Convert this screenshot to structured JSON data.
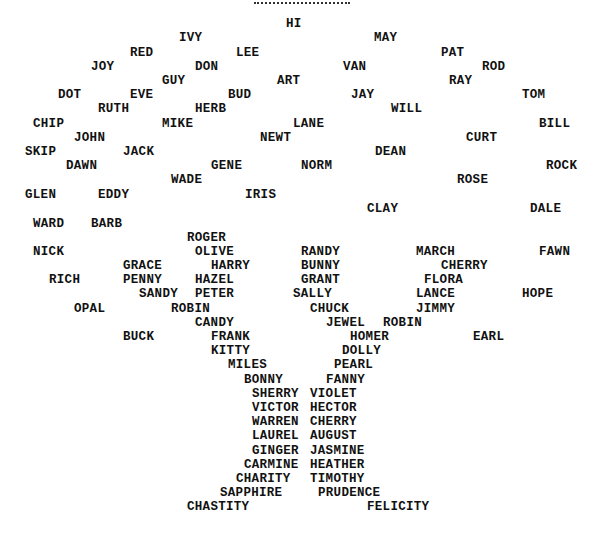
{
  "figure": {
    "names": [
      {
        "text": "HI",
        "x": 286,
        "y": 24
      },
      {
        "text": "IVY",
        "x": 179,
        "y": 38
      },
      {
        "text": "MAY",
        "x": 374,
        "y": 38
      },
      {
        "text": "RED",
        "x": 130,
        "y": 53
      },
      {
        "text": "LEE",
        "x": 236,
        "y": 53
      },
      {
        "text": "PAT",
        "x": 441,
        "y": 53
      },
      {
        "text": "JOY",
        "x": 91,
        "y": 67
      },
      {
        "text": "DON",
        "x": 195,
        "y": 67
      },
      {
        "text": "VAN",
        "x": 343,
        "y": 67
      },
      {
        "text": "ROD",
        "x": 482,
        "y": 67
      },
      {
        "text": "GUY",
        "x": 162,
        "y": 81
      },
      {
        "text": "ART",
        "x": 277,
        "y": 81
      },
      {
        "text": "RAY",
        "x": 449,
        "y": 81
      },
      {
        "text": "DOT",
        "x": 58,
        "y": 95
      },
      {
        "text": "EVE",
        "x": 130,
        "y": 95
      },
      {
        "text": "BUD",
        "x": 228,
        "y": 95
      },
      {
        "text": "JAY",
        "x": 351,
        "y": 95
      },
      {
        "text": "TOM",
        "x": 522,
        "y": 95
      },
      {
        "text": "RUTH",
        "x": 98,
        "y": 109
      },
      {
        "text": "HERB",
        "x": 195,
        "y": 109
      },
      {
        "text": "WILL",
        "x": 391,
        "y": 109
      },
      {
        "text": "CHIP",
        "x": 33,
        "y": 124
      },
      {
        "text": "MIKE",
        "x": 162,
        "y": 124
      },
      {
        "text": "LANE",
        "x": 293,
        "y": 124
      },
      {
        "text": "BILL",
        "x": 539,
        "y": 124
      },
      {
        "text": "JOHN",
        "x": 74,
        "y": 138
      },
      {
        "text": "NEWT",
        "x": 260,
        "y": 138
      },
      {
        "text": "CURT",
        "x": 466,
        "y": 138
      },
      {
        "text": "SKIP",
        "x": 25,
        "y": 152
      },
      {
        "text": "JACK",
        "x": 123,
        "y": 152
      },
      {
        "text": "DEAN",
        "x": 375,
        "y": 152
      },
      {
        "text": "DAWN",
        "x": 66,
        "y": 166
      },
      {
        "text": "GENE",
        "x": 211,
        "y": 166
      },
      {
        "text": "NORM",
        "x": 301,
        "y": 166
      },
      {
        "text": "ROCK",
        "x": 546,
        "y": 166
      },
      {
        "text": "WADE",
        "x": 171,
        "y": 180
      },
      {
        "text": "ROSE",
        "x": 457,
        "y": 180
      },
      {
        "text": "GLEN",
        "x": 25,
        "y": 195
      },
      {
        "text": "EDDY",
        "x": 98,
        "y": 195
      },
      {
        "text": "IRIS",
        "x": 245,
        "y": 195
      },
      {
        "text": "CLAY",
        "x": 367,
        "y": 209
      },
      {
        "text": "DALE",
        "x": 530,
        "y": 209
      },
      {
        "text": "WARD",
        "x": 33,
        "y": 224
      },
      {
        "text": "BARB",
        "x": 91,
        "y": 224
      },
      {
        "text": "ROGER",
        "x": 187,
        "y": 238
      },
      {
        "text": "NICK",
        "x": 33,
        "y": 252
      },
      {
        "text": "OLIVE",
        "x": 195,
        "y": 252
      },
      {
        "text": "RANDY",
        "x": 301,
        "y": 252
      },
      {
        "text": "MARCH",
        "x": 416,
        "y": 252
      },
      {
        "text": "FAWN",
        "x": 539,
        "y": 252
      },
      {
        "text": "GRACE",
        "x": 123,
        "y": 266
      },
      {
        "text": "HARRY",
        "x": 211,
        "y": 266
      },
      {
        "text": "BUNNY",
        "x": 301,
        "y": 266
      },
      {
        "text": "CHERRY",
        "x": 441,
        "y": 266
      },
      {
        "text": "RICH",
        "x": 49,
        "y": 280
      },
      {
        "text": "PENNY",
        "x": 123,
        "y": 280
      },
      {
        "text": "HAZEL",
        "x": 195,
        "y": 280
      },
      {
        "text": "GRANT",
        "x": 301,
        "y": 280
      },
      {
        "text": "FLORA",
        "x": 424,
        "y": 280
      },
      {
        "text": "SANDY",
        "x": 139,
        "y": 294
      },
      {
        "text": "PETER",
        "x": 195,
        "y": 294
      },
      {
        "text": "SALLY",
        "x": 293,
        "y": 294
      },
      {
        "text": "LANCE",
        "x": 416,
        "y": 294
      },
      {
        "text": "HOPE",
        "x": 522,
        "y": 294
      },
      {
        "text": "OPAL",
        "x": 74,
        "y": 309
      },
      {
        "text": "ROBIN",
        "x": 171,
        "y": 309
      },
      {
        "text": "CHUCK",
        "x": 310,
        "y": 309
      },
      {
        "text": "JIMMY",
        "x": 416,
        "y": 309
      },
      {
        "text": "CANDY",
        "x": 195,
        "y": 323
      },
      {
        "text": "JEWEL",
        "x": 326,
        "y": 323
      },
      {
        "text": "ROBIN",
        "x": 383,
        "y": 323
      },
      {
        "text": "BUCK",
        "x": 123,
        "y": 337
      },
      {
        "text": "FRANK",
        "x": 211,
        "y": 337
      },
      {
        "text": "HOMER",
        "x": 350,
        "y": 337
      },
      {
        "text": "EARL",
        "x": 473,
        "y": 337
      },
      {
        "text": "KITTY",
        "x": 211,
        "y": 351
      },
      {
        "text": "DOLLY",
        "x": 342,
        "y": 351
      },
      {
        "text": "MILES",
        "x": 228,
        "y": 365
      },
      {
        "text": "PEARL",
        "x": 334,
        "y": 365
      },
      {
        "text": "BONNY",
        "x": 244,
        "y": 380
      },
      {
        "text": "FANNY",
        "x": 326,
        "y": 380
      },
      {
        "text": "SHERRY",
        "x": 252,
        "y": 394
      },
      {
        "text": "VIOLET",
        "x": 310,
        "y": 394
      },
      {
        "text": "VICTOR",
        "x": 252,
        "y": 408
      },
      {
        "text": "HECTOR",
        "x": 310,
        "y": 408
      },
      {
        "text": "WARREN",
        "x": 252,
        "y": 422
      },
      {
        "text": "CHERRY",
        "x": 310,
        "y": 422
      },
      {
        "text": "LAUREL",
        "x": 252,
        "y": 436
      },
      {
        "text": "AUGUST",
        "x": 310,
        "y": 436
      },
      {
        "text": "GINGER",
        "x": 252,
        "y": 451
      },
      {
        "text": "JASMINE",
        "x": 310,
        "y": 451
      },
      {
        "text": "CARMINE",
        "x": 244,
        "y": 465
      },
      {
        "text": "HEATHER",
        "x": 310,
        "y": 465
      },
      {
        "text": "CHARITY",
        "x": 236,
        "y": 479
      },
      {
        "text": "TIMOTHY",
        "x": 310,
        "y": 479
      },
      {
        "text": "SAPPHIRE",
        "x": 220,
        "y": 493
      },
      {
        "text": "PRUDENCE",
        "x": 318,
        "y": 493
      },
      {
        "text": "CHASTITY",
        "x": 187,
        "y": 507
      },
      {
        "text": "FELICITY",
        "x": 367,
        "y": 507
      }
    ]
  }
}
